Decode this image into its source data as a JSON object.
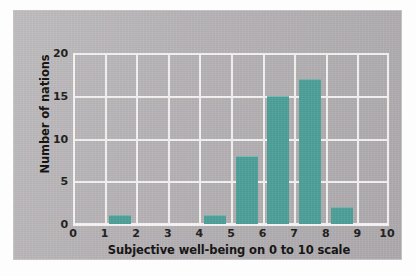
{
  "chart_data": {
    "type": "bar",
    "title": "",
    "subtitle": "",
    "xlabel": "Subjective well-being on 0 to 10 scale",
    "ylabel": "Number of nations",
    "xlim": [
      0,
      10
    ],
    "ylim": [
      0,
      20
    ],
    "xticks": [
      "0",
      "1",
      "2",
      "3",
      "4",
      "5",
      "6",
      "7",
      "8",
      "9",
      "10"
    ],
    "yticks": [
      "0",
      "5",
      "10",
      "15",
      "20"
    ],
    "grid": true,
    "legend": "none",
    "bin_width": 1,
    "bar_color": "#4c9f99",
    "plot_background": "#b4b0b3",
    "gridline_color": "#f4f3f2",
    "categories": [
      "0-1",
      "1-2",
      "2-3",
      "3-4",
      "4-5",
      "5-6",
      "6-7",
      "7-8",
      "8-9",
      "9-10"
    ],
    "bin_centers": [
      0.5,
      1.5,
      2.5,
      3.5,
      4.5,
      5.5,
      6.5,
      7.5,
      8.5,
      9.5
    ],
    "values": [
      0,
      1,
      0,
      0,
      1,
      8,
      15,
      17,
      2,
      0
    ],
    "series": [
      {
        "name": "Number of nations",
        "values": [
          0,
          1,
          0,
          0,
          1,
          8,
          15,
          17,
          2,
          0
        ]
      }
    ]
  }
}
